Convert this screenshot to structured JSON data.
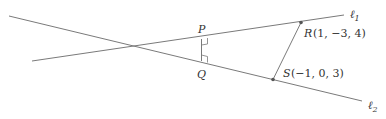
{
  "diagram": {
    "line1": {
      "label_main": "ℓ",
      "label_sub": "1"
    },
    "line2": {
      "label_main": "ℓ",
      "label_sub": "2"
    },
    "points": {
      "P": {
        "name": "P"
      },
      "Q": {
        "name": "Q"
      },
      "R": {
        "name": "R",
        "coords": "(1, −3, 4)"
      },
      "S": {
        "name": "S",
        "coords": "(−1, 0, 3)"
      }
    },
    "colors": {
      "line": "#7a7a7a",
      "point": "#555555",
      "text": "#333333"
    }
  }
}
